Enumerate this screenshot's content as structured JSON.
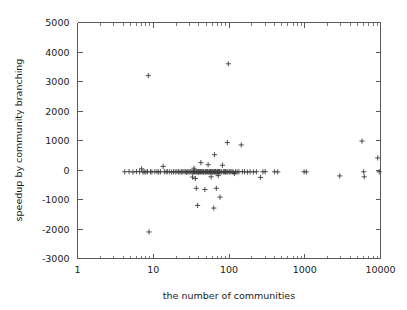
{
  "chart_data": {
    "type": "scatter",
    "title": "",
    "xlabel": "the number of communities",
    "ylabel": "speedup by community branching",
    "xscale": "log",
    "yscale": "linear",
    "xlim": [
      1,
      10000
    ],
    "ylim": [
      -3000,
      5000
    ],
    "grid": false,
    "legend": null,
    "marker": "plus",
    "marker_color": "#3c3c3c",
    "xticks": [
      1,
      10,
      100,
      1000,
      10000
    ],
    "xtick_labels": [
      "1",
      "10",
      "100",
      "1000",
      "10000"
    ],
    "yticks": [
      -3000,
      -2000,
      -1000,
      0,
      1000,
      2000,
      3000,
      4000,
      5000
    ],
    "ytick_labels": [
      "-3000",
      "-2000",
      "-1000",
      "0",
      "1000",
      "2000",
      "3000",
      "4000",
      "5000"
    ],
    "points": [
      [
        4.2,
        -60
      ],
      [
        4.8,
        -55
      ],
      [
        5.4,
        -70
      ],
      [
        6.0,
        -50
      ],
      [
        6.6,
        -60
      ],
      [
        7.0,
        40
      ],
      [
        7.3,
        -65
      ],
      [
        7.6,
        -60
      ],
      [
        8.0,
        -70
      ],
      [
        8.4,
        -55
      ],
      [
        8.6,
        3200
      ],
      [
        8.8,
        -2100
      ],
      [
        9.2,
        -60
      ],
      [
        9.6,
        -65
      ],
      [
        10.5,
        -60
      ],
      [
        11.2,
        -55
      ],
      [
        11.8,
        -70
      ],
      [
        12.5,
        -60
      ],
      [
        13.5,
        120
      ],
      [
        14.0,
        -60
      ],
      [
        14.8,
        -65
      ],
      [
        15.5,
        -55
      ],
      [
        16.5,
        -60
      ],
      [
        17.5,
        -70
      ],
      [
        18.5,
        -60
      ],
      [
        19.5,
        -65
      ],
      [
        20.5,
        -55
      ],
      [
        21.5,
        -60
      ],
      [
        22.5,
        -70
      ],
      [
        23.5,
        -60
      ],
      [
        24.5,
        -65
      ],
      [
        25.5,
        -55
      ],
      [
        26.5,
        -60
      ],
      [
        27.5,
        -75
      ],
      [
        28.5,
        -60
      ],
      [
        29.5,
        -65
      ],
      [
        30.5,
        -60
      ],
      [
        31.5,
        -55
      ],
      [
        32.5,
        -70
      ],
      [
        33.0,
        -240
      ],
      [
        33.5,
        -60
      ],
      [
        34.0,
        -65
      ],
      [
        34.5,
        60
      ],
      [
        35.0,
        -60
      ],
      [
        35.5,
        -55
      ],
      [
        36.0,
        -290
      ],
      [
        36.5,
        -60
      ],
      [
        37.0,
        -620
      ],
      [
        37.5,
        -65
      ],
      [
        38.0,
        -60
      ],
      [
        38.5,
        -1200
      ],
      [
        39.0,
        -55
      ],
      [
        39.5,
        -60
      ],
      [
        40.0,
        -70
      ],
      [
        41.0,
        -60
      ],
      [
        42.0,
        -65
      ],
      [
        42.5,
        250
      ],
      [
        43.0,
        -60
      ],
      [
        44.0,
        -55
      ],
      [
        45.0,
        -60
      ],
      [
        46.0,
        -70
      ],
      [
        47.0,
        -60
      ],
      [
        48.0,
        -660
      ],
      [
        49.0,
        -65
      ],
      [
        50.0,
        -60
      ],
      [
        51.0,
        -55
      ],
      [
        52.0,
        -60
      ],
      [
        53.0,
        180
      ],
      [
        54.0,
        -70
      ],
      [
        55.0,
        -60
      ],
      [
        56.0,
        -65
      ],
      [
        57.0,
        -60
      ],
      [
        58.0,
        -230
      ],
      [
        59.0,
        -55
      ],
      [
        60.0,
        -60
      ],
      [
        61.0,
        -70
      ],
      [
        62.0,
        -60
      ],
      [
        63.0,
        -1290
      ],
      [
        64.0,
        -65
      ],
      [
        64.5,
        520
      ],
      [
        65.0,
        -60
      ],
      [
        66.0,
        -55
      ],
      [
        67.0,
        -60
      ],
      [
        68.0,
        -620
      ],
      [
        69.0,
        -70
      ],
      [
        70.0,
        -60
      ],
      [
        71.0,
        -65
      ],
      [
        72.0,
        -190
      ],
      [
        73.0,
        -60
      ],
      [
        74.0,
        -55
      ],
      [
        75.0,
        -60
      ],
      [
        76.0,
        -920
      ],
      [
        78.0,
        -70
      ],
      [
        80.0,
        -60
      ],
      [
        82.0,
        160
      ],
      [
        84.0,
        -65
      ],
      [
        86.0,
        -60
      ],
      [
        88.0,
        -55
      ],
      [
        90.0,
        -60
      ],
      [
        92.0,
        -70
      ],
      [
        95.0,
        930
      ],
      [
        96.0,
        -60
      ],
      [
        98.0,
        3600
      ],
      [
        100.0,
        -65
      ],
      [
        103.0,
        -60
      ],
      [
        106.0,
        -55
      ],
      [
        110.0,
        -60
      ],
      [
        114.0,
        -70
      ],
      [
        118.0,
        -120
      ],
      [
        122.0,
        -60
      ],
      [
        128.0,
        -65
      ],
      [
        135.0,
        -60
      ],
      [
        145.0,
        850
      ],
      [
        150.0,
        -55
      ],
      [
        160.0,
        -60
      ],
      [
        175.0,
        -70
      ],
      [
        190.0,
        -60
      ],
      [
        210.0,
        -65
      ],
      [
        230.0,
        -60
      ],
      [
        260.0,
        -250
      ],
      [
        280.0,
        -60
      ],
      [
        300.0,
        -55
      ],
      [
        400.0,
        -60
      ],
      [
        440.0,
        -65
      ],
      [
        980.0,
        -60
      ],
      [
        1050.0,
        -65
      ],
      [
        2900.0,
        -200
      ],
      [
        5700.0,
        980
      ],
      [
        6000.0,
        -60
      ],
      [
        6100.0,
        -230
      ],
      [
        9200.0,
        410
      ],
      [
        9600.0,
        -60
      ]
    ]
  },
  "figure": {
    "background": "#ffffff",
    "frame_color": "#5a5a5a",
    "text_color": "#1a1a1a"
  }
}
